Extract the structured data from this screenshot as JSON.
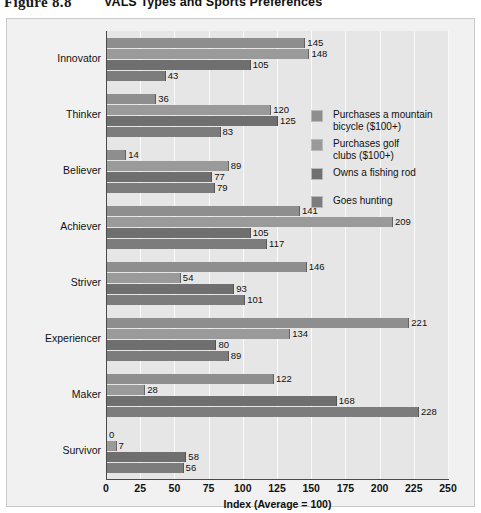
{
  "figure": {
    "number": "Figure 8.8",
    "title": "VALS Types and Sports Preferences"
  },
  "chart_data": {
    "type": "bar",
    "orientation": "horizontal",
    "title": "VALS Types and Sports Preferences",
    "xlabel": "Index (Average = 100)",
    "ylabel": "",
    "xlim": [
      0,
      250
    ],
    "xticks": [
      0,
      25,
      50,
      75,
      100,
      125,
      150,
      175,
      200,
      225,
      250
    ],
    "grid": true,
    "legend_position": "inside-upper-right",
    "categories": [
      "Innovator",
      "Thinker",
      "Believer",
      "Achiever",
      "Striver",
      "Experiencer",
      "Maker",
      "Survivor"
    ],
    "series": [
      {
        "name": "Purchases a mountain bicycle ($100+)",
        "color": "#8e8e8e",
        "values": [
          145,
          36,
          14,
          141,
          146,
          221,
          122,
          0
        ]
      },
      {
        "name": "Purchases golf clubs ($100+)",
        "color": "#9a9a9a",
        "values": [
          148,
          120,
          89,
          209,
          54,
          134,
          28,
          7
        ]
      },
      {
        "name": "Owns a fishing rod",
        "color": "#6f6f6f",
        "values": [
          105,
          125,
          77,
          105,
          93,
          80,
          168,
          58
        ]
      },
      {
        "name": "Goes hunting",
        "color": "#7c7c7c",
        "values": [
          43,
          83,
          79,
          117,
          101,
          89,
          228,
          56
        ]
      }
    ]
  },
  "legend": {
    "items": [
      {
        "label_line1": "Purchases a mountain",
        "label_line2": "bicycle ($100+)",
        "color": "#8e8e8e"
      },
      {
        "label_line1": "Purchases golf",
        "label_line2": "clubs ($100+)",
        "color": "#9a9a9a"
      },
      {
        "label_line1": "Owns a fishing rod",
        "label_line2": "",
        "color": "#6f6f6f"
      },
      {
        "label_line1": "Goes hunting",
        "label_line2": "",
        "color": "#7c7c7c"
      }
    ]
  }
}
